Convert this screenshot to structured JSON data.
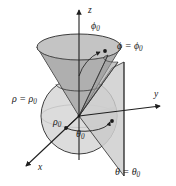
{
  "figure": {
    "background_color": "#ffffff",
    "stroke_color": "#2a2a2a",
    "axes": {
      "z_label": "z",
      "y_label": "y",
      "x_label": "x"
    },
    "labels": {
      "phi_angle": "ϕ",
      "phi_angle_sub": "0",
      "rho_angle": "ρ",
      "rho_angle_sub": "0",
      "theta_angle": "θ",
      "theta_angle_sub": "0",
      "phi_surface_lhs": "ϕ = ϕ",
      "phi_surface_sub": "0",
      "rho_surface_lhs": "ρ = ρ",
      "rho_surface_sub": "0",
      "theta_surface_lhs": "θ = θ",
      "theta_surface_sub": "0"
    },
    "surfaces": [
      {
        "name": "sphere",
        "equation": "ρ = ρ₀",
        "fill_color": "#dcdcdc",
        "stroke_color": "#2a2a2a"
      },
      {
        "name": "cone",
        "equation": "ϕ = ϕ₀",
        "fill_color": "#b9b9b9",
        "stroke_color": "#2a2a2a"
      },
      {
        "name": "half-plane",
        "equation": "θ = θ₀",
        "fill_color": "#cfcfcf",
        "stroke_color": "#2a2a2a"
      }
    ]
  }
}
